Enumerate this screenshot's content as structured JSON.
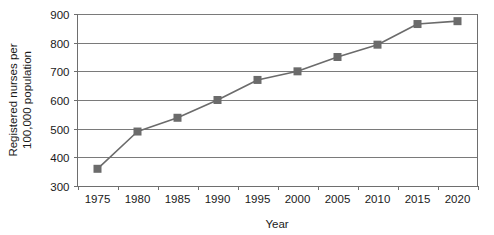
{
  "chart_data": {
    "type": "line",
    "title": "",
    "subtitle": "",
    "xlabel": "Year",
    "ylabel": "Registered nurses per 100,000 population",
    "ylabel_lines": [
      "Registered nurses per",
      "100,000 population"
    ],
    "categories": [
      "1975",
      "1980",
      "1985",
      "1990",
      "1995",
      "2000",
      "2005",
      "2010",
      "2015",
      "2020"
    ],
    "x": [
      1975,
      1980,
      1985,
      1990,
      1995,
      2000,
      2005,
      2010,
      2015,
      2020
    ],
    "values": [
      360,
      490,
      538,
      600,
      670,
      700,
      750,
      793,
      865,
      875
    ],
    "series": [
      {
        "name": "Registered nurses per 100,000 population",
        "values": [
          360,
          490,
          538,
          600,
          670,
          700,
          750,
          793,
          865,
          875
        ]
      }
    ],
    "ylim": [
      300,
      900
    ],
    "ytick_values": [
      300,
      400,
      500,
      600,
      700,
      800,
      900
    ],
    "ytick_labels": [
      "300",
      "400",
      "500",
      "600",
      "700",
      "800",
      "900"
    ],
    "xtick_labels": [
      "1975",
      "1980",
      "1985",
      "1990",
      "1995",
      "2000",
      "2005",
      "2010",
      "2015",
      "2020"
    ],
    "grid": "horizontal",
    "legend": "none",
    "marker": "square",
    "colors": {
      "series_line": "#6b6b6b",
      "marker": "#6b6b6b",
      "gridline": "#7a7a7a",
      "axis": "#6e6e6e",
      "text": "#1a1a1a",
      "background": "#ffffff"
    }
  }
}
